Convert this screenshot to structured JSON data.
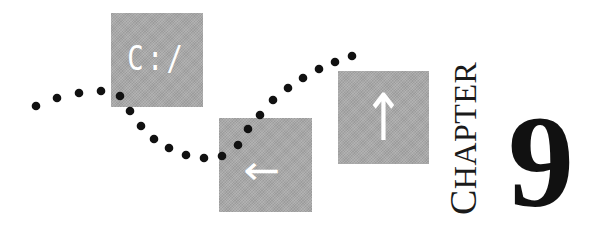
{
  "decor": {
    "drive_box_text": "C:/",
    "left_arrow_icon": "left-arrow",
    "up_arrow_icon": "up-arrow"
  },
  "heading": {
    "chapter_first_letter": "C",
    "chapter_rest": "HAPTER",
    "chapter_number": "9"
  },
  "colors": {
    "box_gray": "#a9a9a9",
    "dot_black": "#111111",
    "text_black": "#111111"
  }
}
